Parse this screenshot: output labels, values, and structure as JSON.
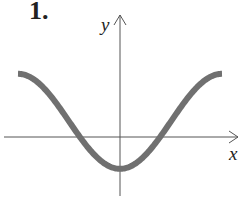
{
  "problem_number": "1.",
  "chart_data": {
    "type": "line",
    "title": "",
    "xlabel": "x",
    "ylabel": "y",
    "grid": false,
    "ticks": "none",
    "function_approx": "y = 0.33 - cos(x), x in [-pi, pi]",
    "x": [
      -3.1416,
      -2.3562,
      -1.5708,
      -1.23,
      -0.7854,
      0,
      0.7854,
      1.23,
      1.5708,
      2.3562,
      3.1416
    ],
    "y": [
      1.33,
      1.04,
      0.33,
      0.0,
      -0.38,
      -0.67,
      -0.38,
      0.0,
      0.33,
      1.04,
      1.33
    ],
    "xlim": [
      -3.5,
      3.9
    ],
    "ylim": [
      -1.2,
      2.3
    ],
    "curve_color": "#707070",
    "axis_color": "#555555"
  }
}
